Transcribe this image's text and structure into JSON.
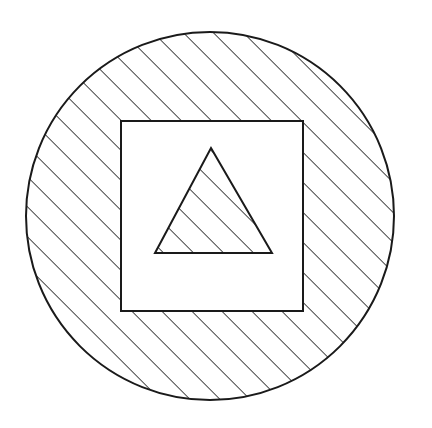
{
  "canvas": {
    "width": 432,
    "height": 428,
    "background_color": "#ffffff",
    "title": "Hatched circle containing an unhatched square containing a hatched triangle"
  },
  "style": {
    "stroke_color": "#1a1a1a",
    "fill_color": "#ffffff",
    "outline_stroke_width": 2,
    "hatch_stroke_width": 1.6,
    "hatch_angle_degrees": 45,
    "hatch_direction": "lower-left to upper-right",
    "hatch_spacing_px": 15
  },
  "shapes": [
    {
      "name": "circle",
      "type": "circle",
      "center_x": 210,
      "center_y": 216,
      "radius": 184,
      "hatched": true,
      "fill": "#ffffff",
      "stroke": "#1a1a1a",
      "label": "Outer circle"
    },
    {
      "name": "square",
      "type": "rect",
      "x": 121,
      "y": 121,
      "width": 182,
      "height": 190,
      "hatched": false,
      "fill": "#ffffff",
      "stroke": "#1a1a1a",
      "label": "Middle square"
    },
    {
      "name": "triangle",
      "type": "polygon",
      "points": "211,148 272,253 155,253",
      "apex_x": 211,
      "apex_y": 148,
      "base_left_x": 155,
      "base_right_x": 272,
      "base_y": 253,
      "hatched": true,
      "fill": "#ffffff",
      "stroke": "#1a1a1a",
      "label": "Inner triangle"
    }
  ]
}
